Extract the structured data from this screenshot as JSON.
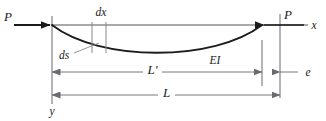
{
  "figure": {
    "colors": {
      "beam": "#1a1a1a",
      "axis": "#55555a",
      "dimension": "#6a6a70",
      "thin": "#8a8a90",
      "label": "#1a1a1a",
      "background": "#ffffff"
    },
    "labels": {
      "load_left": "P",
      "load_right": "P",
      "axis_x": "x",
      "axis_y": "y",
      "element_dx": "dx",
      "element_ds": "ds",
      "stiffness": "EI",
      "length_deformed": "L'",
      "length_original": "L",
      "shortening": "e"
    },
    "geometry": {
      "left_support_x": 52,
      "right_end_x": 262,
      "original_end_x": 280,
      "axis_y": 25,
      "curve_mid_y": 45,
      "dx_line_left": 92,
      "dx_line_right": 106,
      "dim_lprime_y": 72,
      "dim_l_y": 95
    }
  }
}
